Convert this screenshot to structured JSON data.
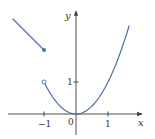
{
  "chart_data": {
    "type": "line",
    "title": "",
    "xlabel": "x",
    "ylabel": "y",
    "xlim": [
      -2.1,
      2.05
    ],
    "ylim": [
      -0.65,
      3.2
    ],
    "grid": false,
    "legend": null,
    "x_tick_labels": [
      "-1",
      "0",
      "1"
    ],
    "x_ticks": [
      -1,
      0,
      1
    ],
    "y_tick_labels": [
      "1"
    ],
    "y_ticks": [
      1
    ],
    "origin_label": "0",
    "series": [
      {
        "name": "left-piece",
        "formula": "y = -x + 1",
        "domain": [
          -2,
          -1
        ],
        "x": [
          -2,
          -1
        ],
        "y": [
          3,
          2
        ],
        "right_endpoint": {
          "x": -1,
          "y": 2,
          "style": "closed"
        }
      },
      {
        "name": "right-piece",
        "formula": "y = x^2",
        "domain": [
          -1,
          1.66
        ],
        "x": [
          -1,
          -0.75,
          -0.5,
          -0.25,
          0,
          0.25,
          0.5,
          0.75,
          1,
          1.25,
          1.5,
          1.66
        ],
        "y": [
          1,
          0.5625,
          0.25,
          0.0625,
          0,
          0.0625,
          0.25,
          0.5625,
          1,
          1.5625,
          2.25,
          2.76
        ],
        "left_endpoint": {
          "x": -1,
          "y": 1,
          "style": "open"
        }
      }
    ]
  },
  "colors": {
    "curve": "#4a6fa5",
    "axis": "#3a3a3a",
    "text": "#333333"
  },
  "labels": {
    "x_axis": "x",
    "y_axis": "y",
    "tick_neg1": "−1",
    "tick_0": "0",
    "tick_1": "1",
    "y_tick_1": "1"
  }
}
